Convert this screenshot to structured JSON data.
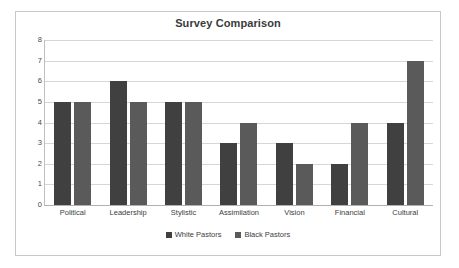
{
  "chart_data": {
    "type": "bar",
    "title": "Survey Comparison",
    "xlabel": "",
    "ylabel": "",
    "ylim": [
      0,
      8
    ],
    "ytick_step": 1,
    "yticks": [
      0,
      1,
      2,
      3,
      4,
      5,
      6,
      7,
      8
    ],
    "grid": true,
    "legend_position": "bottom",
    "categories": [
      "Political",
      "Leadership",
      "Stylistic",
      "Assimilation",
      "Vision",
      "Financial",
      "Cultural"
    ],
    "series": [
      {
        "name": "White Pastors",
        "color": "#404040",
        "values": [
          5,
          6,
          5,
          3,
          3,
          2,
          4
        ]
      },
      {
        "name": "Black Pastors",
        "color": "#5a5a5a",
        "values": [
          5,
          5,
          5,
          4,
          2,
          4,
          7
        ]
      }
    ]
  },
  "colors": {
    "frame_border": "#c9c9c9",
    "gridline": "#d6d6d6",
    "axis": "#b0b0b0",
    "title_text": "#3a3a3a",
    "label_text": "#3d3d3d"
  }
}
